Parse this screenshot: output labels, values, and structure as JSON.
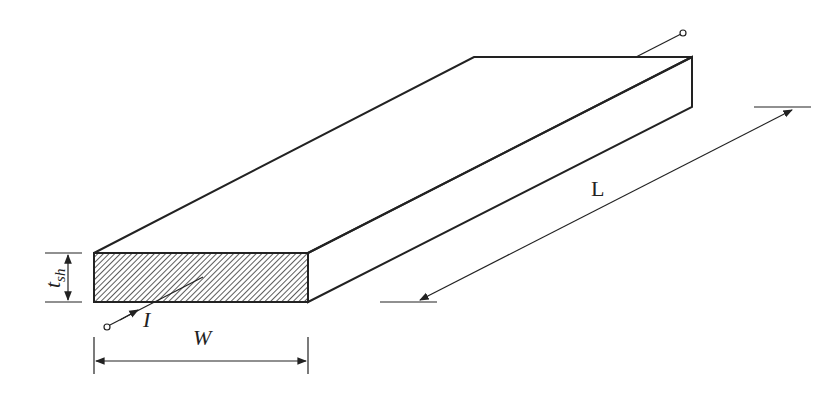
{
  "diagram": {
    "type": "isometric-conductor-sheet",
    "labels": {
      "thickness": "t",
      "thickness_sub": "sh",
      "width": "W",
      "length": "L",
      "current": "I"
    },
    "colors": {
      "stroke": "#222222",
      "background": "#ffffff",
      "hatch": "#222222"
    }
  }
}
